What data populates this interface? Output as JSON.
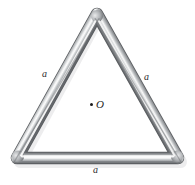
{
  "figure": {
    "type": "equilateral-triangle-rod-loop",
    "background_color": "#ffffff",
    "labels": {
      "side_left": "a",
      "side_right": "a",
      "side_bottom": "a",
      "center_point": "O"
    },
    "geometry": {
      "apex": [
        97,
        14
      ],
      "bottom_left": [
        17,
        158
      ],
      "bottom_right": [
        178,
        158
      ],
      "center": [
        97.3,
        110
      ],
      "rod_thickness_px": 11,
      "side_count": 3
    },
    "colors": {
      "rod_dark_edge": "#6f7174",
      "rod_mid": "#a8abae",
      "rod_highlight": "#f2f3f4",
      "rod_shadow": "#5d6063",
      "dot": "#1a1a1a",
      "text": "#2b2b2b"
    }
  }
}
